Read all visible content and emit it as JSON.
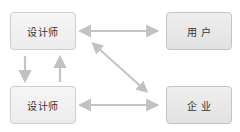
{
  "diagram": {
    "nodes": [
      {
        "id": "designer_top",
        "label": "设计师"
      },
      {
        "id": "user",
        "label": "用 户"
      },
      {
        "id": "designer_bottom",
        "label": "设计师"
      },
      {
        "id": "enterprise",
        "label": "企 业"
      }
    ],
    "edges": [
      {
        "from": "designer_top",
        "to": "user",
        "type": "bidirectional"
      },
      {
        "from": "designer_top",
        "to": "enterprise",
        "type": "bidirectional"
      },
      {
        "from": "designer_bottom",
        "to": "enterprise",
        "type": "bidirectional"
      },
      {
        "from": "designer_top",
        "to": "designer_bottom",
        "type": "unidirectional"
      },
      {
        "from": "designer_bottom",
        "to": "designer_top",
        "type": "unidirectional"
      }
    ],
    "colors": {
      "arrow": "#bdbdbd",
      "box_border": "#cfcfcf",
      "box_fill": "#eeeeee",
      "text": "#333333"
    }
  }
}
